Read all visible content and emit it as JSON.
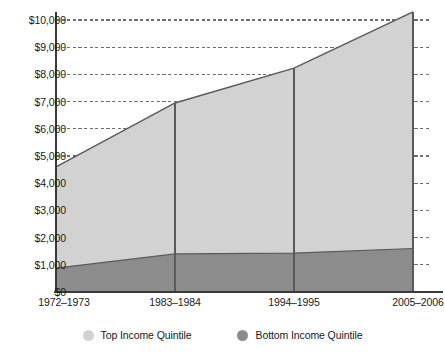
{
  "chart_data": {
    "type": "area",
    "title": "",
    "subtitle": "",
    "xlabel": "",
    "ylabel": "",
    "stacked": true,
    "grid": true,
    "grid_style": "dotted horizontal",
    "legend_position": "bottom-center",
    "categories": [
      "1972–1973",
      "1983–1984",
      "1994–1995",
      "2005–2006"
    ],
    "x_tick_labels": [
      "1972–1973",
      "1983–1984",
      "1994–1995",
      "2005–2006"
    ],
    "y_tick_labels": [
      "$10,000",
      "$9,000",
      "$8,000",
      "$7,000",
      "$6,000",
      "$5,000",
      "$4,000",
      "$3,000",
      "$2,000",
      "$1,000",
      "$0"
    ],
    "y_tick_values": [
      10000,
      9000,
      8000,
      7000,
      6000,
      5000,
      4000,
      3000,
      2000,
      1000,
      0
    ],
    "ylim": [
      0,
      10000
    ],
    "y_tick_step": 1000,
    "series": [
      {
        "name": "Top Income Quintile",
        "color": "#d2d2d2",
        "values": [
          3720,
          5550,
          6800,
          8700
        ]
      },
      {
        "name": "Bottom Income Quintile",
        "color": "#8c8c8c",
        "values": [
          880,
          1400,
          1430,
          1600
        ]
      }
    ],
    "legend": [
      {
        "label": "Top Income Quintile",
        "color": "#d2d2d2"
      },
      {
        "label": "Bottom Income Quintile",
        "color": "#8c8c8c"
      }
    ],
    "vertical_dividers": [
      "1983–1984",
      "1994–1995"
    ],
    "axis_color": "#3a3a3a",
    "gridline_color": "#6e6e6e",
    "line_color": "#5a5a5a",
    "background": "#ffffff"
  }
}
